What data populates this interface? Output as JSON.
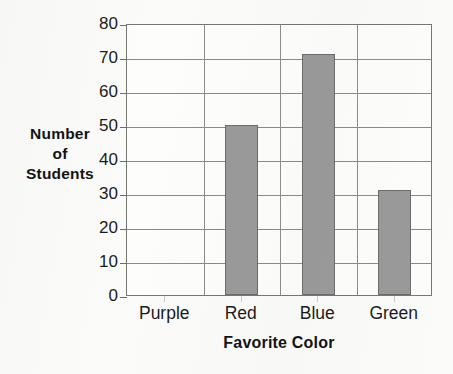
{
  "chart_data": {
    "type": "bar",
    "title": "",
    "subtitle": "",
    "xlabel": "Favorite Color",
    "ylabel": "Number of Students",
    "ylabel_lines": [
      "Number",
      "of",
      "Students"
    ],
    "categories": [
      "Purple",
      "Red",
      "Blue",
      "Green"
    ],
    "values": [
      0,
      50,
      71,
      31
    ],
    "ylim": [
      0,
      80
    ],
    "ytick_step": 10,
    "ytick_labels": [
      "80",
      "70",
      "60",
      "50",
      "40",
      "30",
      "20",
      "10",
      "0"
    ],
    "ytick_values": [
      80,
      70,
      60,
      50,
      40,
      30,
      20,
      10,
      0
    ],
    "grid": "horizontal-and-vertical",
    "legend": "none",
    "annotations": [],
    "bar_fill_color": "#9a9a9a",
    "bar_outline_color": "#6d6d6d",
    "axis_color": "#777772",
    "gridline_color": "#8b8b86",
    "background_color": "#fbfbf9",
    "text_color": "#1b1b1b"
  }
}
